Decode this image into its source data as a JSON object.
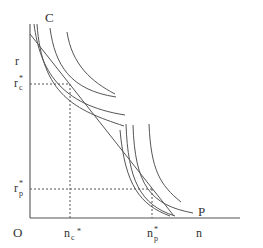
{
  "diagram": {
    "labels": {
      "curve_c": "C",
      "curve_p": "P",
      "y_axis": "r",
      "x_axis": "n",
      "origin": "O",
      "r_c_main": "r",
      "r_c_sub": "c",
      "r_c_sup": "*",
      "r_p_main": "r",
      "r_p_sub": "p",
      "r_p_sup": "*",
      "n_c_main": "n",
      "n_c_sub": "c",
      "n_c_sup": "*",
      "n_p_main": "n",
      "n_p_sub": "p",
      "n_p_sup": "*"
    },
    "colors": {
      "line": "#555555",
      "text": "#333333",
      "background": "#ffffff"
    }
  }
}
